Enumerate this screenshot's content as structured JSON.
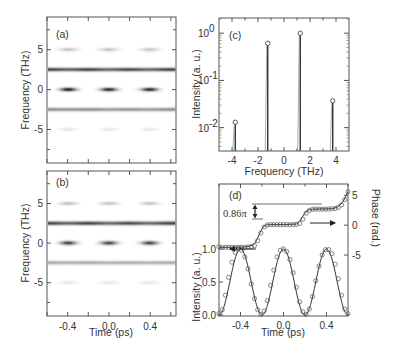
{
  "figure": {
    "panels": {
      "a": {
        "label": "(a)"
      },
      "b": {
        "label": "(b)"
      },
      "c": {
        "label": "(c)"
      },
      "d": {
        "label": "(d)"
      }
    }
  },
  "chart_data": [
    {
      "id": "a",
      "type": "heatmap",
      "title": "(a)",
      "xlabel": "",
      "ylabel": "Frequency (THz)",
      "xlim": [
        -0.6,
        0.65
      ],
      "ylim": [
        -9.2,
        9.1
      ],
      "xticks": [
        -0.6,
        -0.4,
        -0.2,
        0.0,
        0.2,
        0.4,
        0.6
      ],
      "xtick_labels": [],
      "yticks": [
        5,
        0,
        -5
      ],
      "ytick_labels": [
        "5",
        "0",
        "-5"
      ],
      "bands": [
        {
          "freq": 5.0,
          "mode": "pulsed",
          "centers": [
            -0.4,
            0.0,
            0.4
          ],
          "peak_darkness": 0.28,
          "width_ps": 0.11
        },
        {
          "freq": 2.5,
          "mode": "continuous",
          "darkness": 0.78,
          "modulation": 0.1
        },
        {
          "freq": 0.0,
          "mode": "pulsed",
          "centers": [
            -0.4,
            0.0,
            0.4
          ],
          "peak_darkness": 1.0,
          "width_ps": 0.1
        },
        {
          "freq": -2.5,
          "mode": "continuous",
          "darkness": 0.45,
          "modulation": 0.05
        },
        {
          "freq": -5.0,
          "mode": "pulsed",
          "centers": [
            -0.4,
            0.0,
            0.4
          ],
          "peak_darkness": 0.1,
          "width_ps": 0.11
        }
      ]
    },
    {
      "id": "b",
      "type": "heatmap",
      "title": "(b)",
      "xlabel": "Time (ps)",
      "ylabel": "Frequency (THz)",
      "xlim": [
        -0.6,
        0.65
      ],
      "ylim": [
        -9.2,
        9.1
      ],
      "xticks": [
        -0.6,
        -0.4,
        -0.2,
        0.0,
        0.2,
        0.4,
        0.6
      ],
      "xtick_labels": [
        "",
        "-0.4",
        "",
        "0.0",
        "",
        "0.4",
        ""
      ],
      "yticks": [
        5,
        0,
        -5
      ],
      "ytick_labels": [
        "5",
        "0",
        "-5"
      ],
      "bands": [
        {
          "freq": 5.0,
          "mode": "pulsed",
          "centers": [
            -0.4,
            0.0,
            0.4
          ],
          "peak_darkness": 0.25,
          "width_ps": 0.11
        },
        {
          "freq": 2.5,
          "mode": "continuous",
          "darkness": 0.8,
          "modulation": 0.1
        },
        {
          "freq": 0.0,
          "mode": "pulsed",
          "centers": [
            -0.4,
            0.0,
            0.4
          ],
          "peak_darkness": 1.0,
          "width_ps": 0.1
        },
        {
          "freq": -2.5,
          "mode": "continuous",
          "darkness": 0.42,
          "modulation": 0.05
        },
        {
          "freq": -5.0,
          "mode": "pulsed",
          "centers": [
            -0.4,
            0.0,
            0.4
          ],
          "peak_darkness": 0.12,
          "width_ps": 0.11
        }
      ]
    },
    {
      "id": "c",
      "type": "stem",
      "title": "(c)",
      "xlabel": "Frequency (THz)",
      "ylabel": "Intensity (a. u.)",
      "yscale": "log",
      "xlim": [
        -5.0,
        5.0
      ],
      "ylim": [
        0.0032,
        2.1
      ],
      "xticks": [
        -4,
        -2,
        0,
        2,
        4
      ],
      "xtick_labels": [
        "-4",
        "-2",
        "0",
        "2",
        "4"
      ],
      "yticks": [
        1,
        0.1,
        0.01
      ],
      "ytick_labels": [
        [
          "10",
          "0"
        ],
        [
          "10",
          "-1"
        ],
        [
          "10",
          "-2"
        ]
      ],
      "series": [
        {
          "name": "measured (circles)",
          "x": [
            -3.75,
            -1.25,
            1.25,
            3.75
          ],
          "values": [
            0.013,
            0.61,
            1.0,
            0.037
          ]
        },
        {
          "name": "spectrum lines",
          "x": [
            -3.75,
            -1.25,
            1.25,
            3.75
          ],
          "values": [
            0.012,
            0.62,
            0.98,
            0.036
          ]
        }
      ]
    },
    {
      "id": "d",
      "type": "line",
      "title": "(d)",
      "xlabel": "Time (ps)",
      "ylabel": "Intensity (a. u.)",
      "ylabel_right": "Phase (rad.)",
      "xlim": [
        -0.6,
        0.6
      ],
      "ylim": [
        0.0,
        2.0
      ],
      "ylim_right": [
        -15.2,
        6.9
      ],
      "xticks": [
        -0.4,
        0.0,
        0.4
      ],
      "xtick_labels": [
        "-0.4",
        "0.0",
        "0.4"
      ],
      "yticks": [
        0.0,
        0.5,
        1.0
      ],
      "ytick_labels": [
        "0.0",
        "0.5",
        "1.0"
      ],
      "yticks_right": [
        5,
        0,
        -5
      ],
      "ytick_labels_right": [
        "5",
        "0",
        "-5"
      ],
      "annotation": "0.86π",
      "series": [
        {
          "name": "Intensity (measured)",
          "axis": "left",
          "style": "circles",
          "x": [
            -0.6,
            -0.57,
            -0.54,
            -0.51,
            -0.48,
            -0.45,
            -0.42,
            -0.39,
            -0.36,
            -0.33,
            -0.3,
            -0.27,
            -0.24,
            -0.21,
            -0.18,
            -0.15,
            -0.12,
            -0.09,
            -0.06,
            -0.03,
            0.0,
            0.03,
            0.06,
            0.09,
            0.12,
            0.15,
            0.18,
            0.21,
            0.24,
            0.27,
            0.3,
            0.33,
            0.36,
            0.39,
            0.42,
            0.45,
            0.48,
            0.51,
            0.54,
            0.57,
            0.6
          ],
          "values": [
            0.02,
            0.08,
            0.3,
            0.57,
            0.8,
            0.95,
            1.0,
            0.98,
            0.88,
            0.7,
            0.47,
            0.25,
            0.08,
            0.01,
            0.06,
            0.22,
            0.45,
            0.68,
            0.88,
            0.98,
            1.0,
            0.96,
            0.84,
            0.64,
            0.42,
            0.2,
            0.05,
            0.01,
            0.09,
            0.28,
            0.52,
            0.74,
            0.91,
            0.99,
            0.99,
            0.93,
            0.77,
            0.55,
            0.3,
            0.09,
            0.02
          ]
        },
        {
          "name": "Intensity (fit)",
          "axis": "left",
          "style": "line",
          "function": "cos2",
          "period_ps": 0.4,
          "peak_at_ps": 0.0
        },
        {
          "name": "Phase (measured)",
          "axis": "right",
          "style": "circles",
          "x": [
            -0.6,
            -0.57,
            -0.54,
            -0.51,
            -0.48,
            -0.45,
            -0.42,
            -0.39,
            -0.36,
            -0.33,
            -0.3,
            -0.27,
            -0.24,
            -0.21,
            -0.18,
            -0.15,
            -0.12,
            -0.09,
            -0.06,
            -0.03,
            0.0,
            0.03,
            0.06,
            0.09,
            0.12,
            0.15,
            0.18,
            0.21,
            0.24,
            0.27,
            0.3,
            0.33,
            0.36,
            0.39,
            0.42,
            0.45,
            0.48,
            0.51,
            0.54,
            0.57,
            0.6
          ],
          "values": [
            -3.6,
            -3.75,
            -3.7,
            -3.7,
            -3.7,
            -3.7,
            -3.7,
            -3.7,
            -3.7,
            -3.65,
            -3.6,
            -3.4,
            -2.6,
            -1.3,
            -0.3,
            0.05,
            0.1,
            0.1,
            0.1,
            0.1,
            0.1,
            0.1,
            0.1,
            0.1,
            0.15,
            0.3,
            1.0,
            2.0,
            2.5,
            2.65,
            2.7,
            2.7,
            2.7,
            2.7,
            2.7,
            2.75,
            2.8,
            3.0,
            3.4,
            4.3,
            5.6
          ]
        },
        {
          "name": "Phase (fit)",
          "axis": "right",
          "style": "line",
          "x": [
            -0.6,
            -0.5,
            -0.35,
            -0.28,
            -0.25,
            -0.22,
            -0.19,
            -0.16,
            -0.12,
            0.0,
            0.12,
            0.15,
            0.18,
            0.21,
            0.24,
            0.28,
            0.45,
            0.5,
            0.55,
            0.6
          ],
          "values": [
            -3.7,
            -3.7,
            -3.65,
            -3.3,
            -2.5,
            -1.3,
            -0.3,
            0.05,
            0.1,
            0.1,
            0.2,
            0.6,
            1.5,
            2.3,
            2.6,
            2.7,
            2.75,
            3.0,
            3.8,
            5.6
          ]
        }
      ]
    }
  ]
}
